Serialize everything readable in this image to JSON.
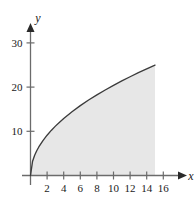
{
  "chart_data": {
    "type": "area",
    "title": "",
    "subtitle": "",
    "xlabel": "x",
    "ylabel": "y",
    "xlim": [
      0,
      17.5
    ],
    "ylim": [
      0,
      34
    ],
    "grid": false,
    "legend": null,
    "x_ticks": [
      2,
      4,
      6,
      8,
      10,
      12,
      14,
      16
    ],
    "x_tick_labels": [
      "2",
      "4",
      "6",
      "8",
      "10",
      "12",
      "14",
      "16"
    ],
    "y_ticks": [
      10,
      20,
      30
    ],
    "y_tick_labels": [
      "10",
      "20",
      "30"
    ],
    "series": [
      {
        "name": "curve",
        "kind": "line",
        "fill": true,
        "fill_color": "#e7e7e7",
        "line_color": "#3b3b3b",
        "x": [
          0,
          0.25,
          0.5,
          0.75,
          1,
          1.5,
          2,
          2.5,
          3,
          3.5,
          4,
          5,
          6,
          7,
          8,
          9,
          10,
          11,
          12,
          13,
          14,
          15
        ],
        "y": [
          0,
          3.23,
          4.56,
          5.59,
          6.45,
          7.9,
          9.12,
          10.2,
          11.17,
          12.07,
          12.9,
          14.42,
          15.8,
          17.07,
          18.24,
          19.35,
          20.4,
          21.39,
          22.34,
          23.26,
          24.13,
          24.98
        ]
      }
    ],
    "shaded_region": {
      "description": "region under curve from x=0 to x=15",
      "x_start": 0,
      "x_end": 15,
      "color": "#e7e7e7"
    },
    "axis_color": "#6b6b6b",
    "text_color": "#1a1a1a"
  },
  "axes": {
    "x_label": "x",
    "y_label": "y"
  }
}
